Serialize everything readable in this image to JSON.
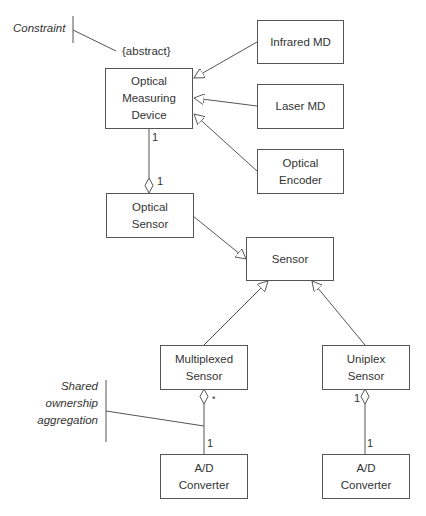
{
  "diagram": {
    "type": "UML class diagram",
    "classes": {
      "optical_measuring_device": [
        "Optical",
        "Measuring",
        "Device"
      ],
      "infrared_md": [
        "Infrared MD"
      ],
      "laser_md": [
        "Laser MD"
      ],
      "optical_encoder": [
        "Optical",
        "Encoder"
      ],
      "optical_sensor": [
        "Optical",
        "Sensor"
      ],
      "sensor": [
        "Sensor"
      ],
      "multiplexed_sensor": [
        "Multiplexed",
        "Sensor"
      ],
      "uniplex_sensor": [
        "Uniplex",
        "Sensor"
      ],
      "ad_converter_left": [
        "A/D",
        "Converter"
      ],
      "ad_converter_right": [
        "A/D",
        "Converter"
      ]
    },
    "constraint": "{abstract}",
    "notes": {
      "constraint": "Constraint",
      "shared": [
        "Shared",
        "ownership",
        "aggregation"
      ]
    },
    "multiplicities": {
      "omd_end": "1",
      "optical_sensor_end": "1",
      "multiplexed_end": "*",
      "ad_left_end": "1",
      "uniplex_end": "1",
      "ad_right_end": "1"
    },
    "relationships": [
      {
        "from": "Infrared MD",
        "to": "Optical Measuring Device",
        "kind": "generalization"
      },
      {
        "from": "Laser MD",
        "to": "Optical Measuring Device",
        "kind": "generalization"
      },
      {
        "from": "Optical Encoder",
        "to": "Optical Measuring Device",
        "kind": "generalization"
      },
      {
        "from": "Optical Measuring Device",
        "to": "Optical Sensor",
        "kind": "aggregation"
      },
      {
        "from": "Optical Sensor",
        "to": "Sensor",
        "kind": "generalization"
      },
      {
        "from": "Multiplexed Sensor",
        "to": "Sensor",
        "kind": "generalization"
      },
      {
        "from": "Uniplex Sensor",
        "to": "Sensor",
        "kind": "generalization"
      },
      {
        "from": "A/D Converter",
        "to": "Multiplexed Sensor",
        "kind": "shared aggregation"
      },
      {
        "from": "A/D Converter",
        "to": "Uniplex Sensor",
        "kind": "aggregation"
      }
    ]
  }
}
